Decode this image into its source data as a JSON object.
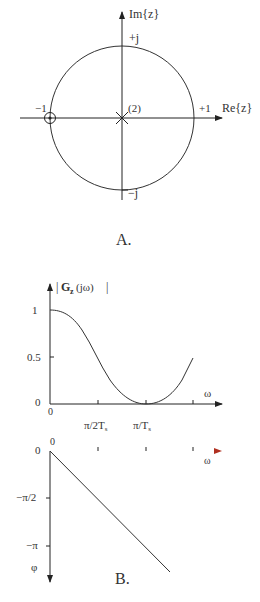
{
  "panel_a": {
    "caption": "A.",
    "im_axis_label": "Im{z}",
    "re_axis_label": "Re{z}",
    "plus_j": "+j",
    "minus_j": "−j",
    "minus_one": "−1",
    "plus_one": "+1",
    "pole_multiplicity": "(2)",
    "zero_location": "z = −1",
    "pole_location": "z = 0 (double)"
  },
  "panel_b": {
    "caption": "B.",
    "magnitude": {
      "ylabel": "|Gz(jω)|",
      "ylabel_main": "G",
      "ylabel_sub": "z",
      "ylabel_arg": "(jω)",
      "y_ticks": [
        "1",
        "0.5",
        "0"
      ],
      "x_ticks": [
        "0",
        "π/2Ts",
        "π/Ts"
      ],
      "x_tick_1_main": "π/2T",
      "x_tick_1_sub": "s",
      "x_tick_2_main": "π/T",
      "x_tick_2_sub": "s",
      "xlabel": "ω"
    },
    "phase": {
      "origin_x": "0",
      "origin_y": "0",
      "y_ticks": [
        "−π/2",
        "−π"
      ],
      "ylabel": "φ",
      "xlabel": "ω"
    }
  },
  "colors": {
    "axis": "#222222",
    "curve": "#333333",
    "phase_axis_start": "#2aa6b8",
    "phase_axis_end": "#e03a2a"
  }
}
